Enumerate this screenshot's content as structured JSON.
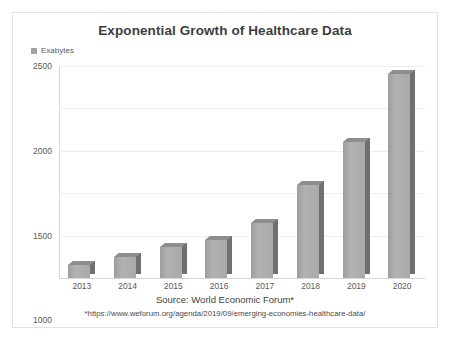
{
  "chart_data": {
    "type": "bar",
    "title": "Exponential Growth of Healthcare Data",
    "categories": [
      "2013",
      "2014",
      "2015",
      "2016",
      "2017",
      "2018",
      "2019",
      "2020"
    ],
    "values": [
      150,
      250,
      370,
      450,
      650,
      1100,
      1600,
      2400
    ],
    "series": [
      {
        "name": "Exabytes",
        "values": [
          150,
          250,
          370,
          450,
          650,
          1100,
          1600,
          2400
        ]
      }
    ],
    "xlabel": "",
    "ylabel": "",
    "ylim": [
      0,
      2500
    ],
    "yticks": [
      "0",
      "500",
      "1000",
      "1500",
      "2000",
      "2500"
    ],
    "ytick_values": [
      0,
      500,
      1000,
      1500,
      2000,
      2500
    ],
    "grid": true,
    "legend": {
      "position": "top-left",
      "entries": [
        "Exabytes"
      ]
    },
    "annotations": [
      "Source: World Economic Forum*",
      "*https://www.weforum.org/agenda/2019/09/emerging-economies-healthcare-data/"
    ],
    "colors": {
      "bar_face": "#a9a9a9",
      "bar_side": "#707070",
      "bar_top": "#8e8e8e",
      "gridline": "#ededed",
      "axis": "#d6d6d6",
      "title_text": "#3d3d3d",
      "tick_text": "#595959"
    }
  },
  "legend": {
    "label": "Exabytes"
  },
  "footnotes": {
    "source": "Source: World Economic Forum*",
    "url": "*https://www.weforum.org/agenda/2019/09/emerging-economies-healthcare-data/"
  }
}
